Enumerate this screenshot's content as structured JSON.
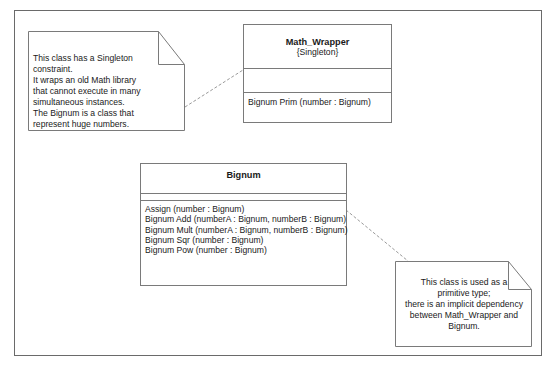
{
  "diagram": {
    "type": "UML class diagram",
    "notes": [
      {
        "id": "note-singleton",
        "lines": [
          "This class has a Singleton",
          "constraint.",
          "It wraps an old Math library",
          "that cannot execute in many",
          "simultaneous instances.",
          "The Bignum is a class that",
          "represent huge numbers."
        ],
        "attached_to": "Math_Wrapper"
      },
      {
        "id": "note-primitive",
        "lines": [
          "This class is used as a",
          "primitive type;",
          "there is an implicit dependency",
          "between Math_Wrapper and",
          "Bignum."
        ],
        "attached_to": "Bignum"
      }
    ],
    "classes": [
      {
        "name": "Math_Wrapper",
        "stereotype": "{Singleton}",
        "attributes": [],
        "operations": [
          "Bignum Prim (number : Bignum)"
        ]
      },
      {
        "name": "Bignum",
        "stereotype": "",
        "attributes": [],
        "operations": [
          "Assign (number : Bignum)",
          "Bignum Add (numberA : Bignum, numberB : Bignum)",
          "Bignum Mult (numberA : Bignum, numberB : Bignum)",
          "Bignum Sqr (number : Bignum)",
          "Bignum Pow (number : Bignum)"
        ]
      }
    ],
    "colors": {
      "line": "#7a7a7a",
      "dashed": "#9a9a9a",
      "text": "#1a1a1a",
      "background": "#ffffff"
    }
  }
}
